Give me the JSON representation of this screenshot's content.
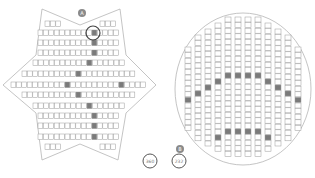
{
  "colors": {
    "background": "#ffffff",
    "outline": "#b5b5b5",
    "seat_stroke": "#9a9a9a",
    "seat_fill": "#ffffff",
    "seat_selected": "#7a7a7a",
    "badge_fill": "#8a8a8a",
    "badge_text": "#ffffff",
    "circle_marker": "#444444",
    "capacity_text": "#777777"
  },
  "left_venue": {
    "badge": "A",
    "capacity_label": "360",
    "outline_points": [
      [
        42,
        9
      ],
      [
        80,
        25
      ],
      [
        120,
        9
      ],
      [
        126,
        55
      ],
      [
        156,
        85
      ],
      [
        126,
        113
      ],
      [
        118,
        160
      ],
      [
        80,
        144
      ],
      [
        42,
        160
      ],
      [
        36,
        113
      ],
      [
        3,
        85
      ],
      [
        36,
        55
      ]
    ],
    "seat_w": 5.4,
    "seat_h": 5.6,
    "rows": [
      {
        "y": 21,
        "groups": [
          {
            "x": 45,
            "n": 3
          },
          {
            "x": 100,
            "n": 3
          }
        ],
        "selected": []
      },
      {
        "y": 30,
        "groups": [
          {
            "x": 38,
            "n": 15
          }
        ],
        "selected": [
          10
        ]
      },
      {
        "y": 40,
        "groups": [
          {
            "x": 38,
            "n": 15
          }
        ],
        "selected": [
          10
        ]
      },
      {
        "y": 50,
        "groups": [
          {
            "x": 38,
            "n": 15
          }
        ],
        "selected": [
          10
        ]
      },
      {
        "y": 60,
        "groups": [
          {
            "x": 33,
            "n": 17
          }
        ],
        "selected": [
          10
        ]
      },
      {
        "y": 71,
        "groups": [
          {
            "x": 22,
            "n": 21
          }
        ],
        "selected": [
          10,
          21
        ]
      },
      {
        "y": 82,
        "groups": [
          {
            "x": 11,
            "n": 25
          }
        ],
        "selected": [
          10,
          20
        ]
      },
      {
        "y": 92,
        "groups": [
          {
            "x": 22,
            "n": 21
          }
        ],
        "selected": [
          10,
          21
        ]
      },
      {
        "y": 103,
        "groups": [
          {
            "x": 33,
            "n": 17
          }
        ],
        "selected": [
          10
        ]
      },
      {
        "y": 113,
        "groups": [
          {
            "x": 38,
            "n": 15
          }
        ],
        "selected": [
          10
        ]
      },
      {
        "y": 123,
        "groups": [
          {
            "x": 38,
            "n": 15
          }
        ],
        "selected": [
          10
        ]
      },
      {
        "y": 134,
        "groups": [
          {
            "x": 38,
            "n": 15
          }
        ],
        "selected": [
          10
        ]
      },
      {
        "y": 144,
        "groups": [
          {
            "x": 45,
            "n": 3
          },
          {
            "x": 100,
            "n": 3
          }
        ],
        "selected": []
      }
    ],
    "marked_seat": {
      "cx": 93,
      "cy": 33,
      "r": 7
    }
  },
  "right_venue": {
    "badge": "B",
    "capacity_label": "232",
    "ellipse": {
      "cx": 243,
      "cy": 89,
      "rx": 68,
      "ry": 76
    },
    "seat_w": 6,
    "seat_h": 5.6,
    "columns": [
      {
        "x": 185,
        "top": 47,
        "count": 15,
        "selected": [
          9
        ]
      },
      {
        "x": 195,
        "top": 35,
        "count": 19,
        "selected": [
          10
        ]
      },
      {
        "x": 205,
        "top": 29,
        "count": 21,
        "selected": [
          10
        ]
      },
      {
        "x": 215,
        "top": 23,
        "count": 23,
        "selected": [
          10,
          20
        ]
      },
      {
        "x": 225,
        "top": 17,
        "count": 25,
        "selected": [
          10,
          20
        ]
      },
      {
        "x": 235,
        "top": 17,
        "count": 25,
        "selected": [
          10,
          20
        ]
      },
      {
        "x": 245,
        "top": 17,
        "count": 25,
        "selected": [
          10,
          20
        ]
      },
      {
        "x": 255,
        "top": 17,
        "count": 25,
        "selected": [
          10,
          20
        ]
      },
      {
        "x": 265,
        "top": 23,
        "count": 23,
        "selected": [
          10,
          20
        ]
      },
      {
        "x": 275,
        "top": 29,
        "count": 21,
        "selected": [
          10
        ]
      },
      {
        "x": 285,
        "top": 35,
        "count": 19,
        "selected": [
          10
        ]
      },
      {
        "x": 295,
        "top": 47,
        "count": 15,
        "selected": [
          9
        ]
      }
    ]
  },
  "badges": [
    {
      "id": "A",
      "cx": 82,
      "cy": 13
    },
    {
      "id": "B",
      "cx": 180,
      "cy": 149
    }
  ],
  "capacity_markers": [
    {
      "label": "360",
      "cx": 150,
      "cy": 161
    },
    {
      "label": "232",
      "cx": 179,
      "cy": 161
    }
  ]
}
